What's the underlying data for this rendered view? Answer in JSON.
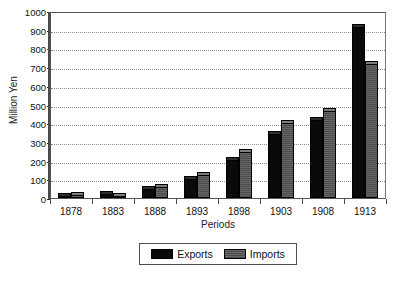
{
  "chart_data": {
    "type": "bar",
    "title": "",
    "subtitle": "",
    "xlabel": "Periods",
    "ylabel": "Million Yen",
    "categories": [
      "1878",
      "1883",
      "1888",
      "1893",
      "1898",
      "1903",
      "1908",
      "1913"
    ],
    "series": [
      {
        "name": "Exports",
        "color": "#0a0a0a",
        "values": [
          26,
          36,
          66,
          120,
          219,
          358,
          432,
          930
        ]
      },
      {
        "name": "Imports",
        "color": "#555555",
        "values": [
          33,
          29,
          73,
          139,
          260,
          415,
          480,
          731
        ]
      }
    ],
    "ylim": [
      0,
      1000
    ],
    "ytick_values": [
      0,
      100,
      200,
      300,
      400,
      500,
      600,
      700,
      800,
      900,
      1000
    ],
    "ytick_labels": [
      "0",
      "100",
      "200",
      "300",
      "400",
      "500",
      "600",
      "700",
      "800",
      "900",
      "1000"
    ],
    "grid": true,
    "grid_axis": "y",
    "grid_style": "dotted",
    "legend": true,
    "legend_position": "bottom-center",
    "legend_entries": [
      "Exports",
      "Imports"
    ],
    "bar_style": "3d-top-cap",
    "background": "#ffffff",
    "frame_color": "#555555"
  }
}
